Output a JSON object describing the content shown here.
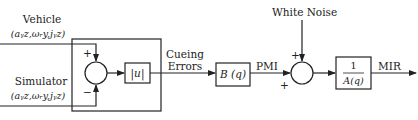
{
  "diagram": {
    "type": "block-diagram",
    "inputs": {
      "vehicle": {
        "label": "Vehicle",
        "signals": "(a_yz, ω_ry, j_yz)",
        "signals_display": "(aᵧz,ωᵣy,jᵧz)"
      },
      "simulator": {
        "label": "Simulator",
        "signals": "(a_yz, ω_ry, j_yz)",
        "signals_display": "(aᵧz,ωᵣy,jᵧz)"
      }
    },
    "sum1": {
      "plus_sign": "+",
      "minus_sign": "−"
    },
    "abs_block": {
      "label": "|u|"
    },
    "cueing_errors": {
      "line1": "Cueing",
      "line2": "Errors"
    },
    "b_block": {
      "label": "B (q)"
    },
    "pmi": {
      "label": "PMI"
    },
    "white_noise": {
      "label": "White Noise"
    },
    "sum2": {
      "plus_top": "+",
      "plus_left": "+"
    },
    "a_block": {
      "numerator": "1",
      "denominator": "A(q)"
    },
    "output": {
      "label": "MIR"
    },
    "colors": {
      "line": "#222222",
      "background": "#ffffff"
    }
  }
}
